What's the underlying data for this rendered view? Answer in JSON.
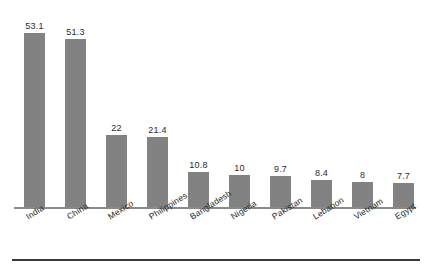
{
  "chart_data": {
    "type": "bar",
    "title": "",
    "subtitle": "",
    "xlabel": "",
    "ylabel": "",
    "ylim": [
      0,
      57
    ],
    "grid": false,
    "legend": "none",
    "orientation": "vertical",
    "value_labels_shown": true,
    "bar_color": "#828282",
    "axis_color": "#8a8a8a",
    "categories": [
      "India",
      "China",
      "Mexico",
      "Philippines",
      "Bangladesh",
      "Nigeria",
      "Pakistan",
      "Lebanon",
      "Vietnam",
      "Egypt"
    ],
    "values": [
      53.1,
      51.3,
      22,
      21.4,
      10.8,
      10,
      9.7,
      8.4,
      8,
      7.7
    ],
    "value_labels": [
      "53.1",
      "51.3",
      "22",
      "21.4",
      "10.8",
      "10",
      "9.7",
      "8.4",
      "8",
      "7.7"
    ],
    "bars": [
      {
        "category": "India",
        "value": 53.1,
        "label": "53.1"
      },
      {
        "category": "China",
        "value": 51.3,
        "label": "51.3"
      },
      {
        "category": "Mexico",
        "value": 22,
        "label": "22"
      },
      {
        "category": "Philippines",
        "value": 21.4,
        "label": "21.4"
      },
      {
        "category": "Bangladesh",
        "value": 10.8,
        "label": "10.8"
      },
      {
        "category": "Nigeria",
        "value": 10,
        "label": "10"
      },
      {
        "category": "Pakistan",
        "value": 9.7,
        "label": "9.7"
      },
      {
        "category": "Lebanon",
        "value": 8.4,
        "label": "8.4"
      },
      {
        "category": "Vietnam",
        "value": 8,
        "label": "8"
      },
      {
        "category": "Egypt",
        "value": 7.7,
        "label": "7.7"
      }
    ]
  }
}
